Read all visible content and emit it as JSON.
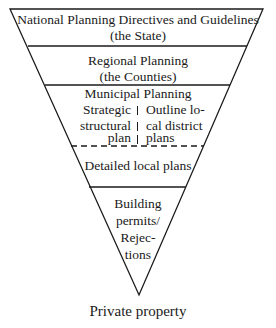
{
  "diagram": {
    "type": "inverted-pyramid",
    "levels": [
      {
        "line1": "National Planning Directives and Guidelines",
        "line2": "(the State)"
      },
      {
        "line1": "Regional Planning",
        "line2": "(the Counties)"
      },
      {
        "title": "Municipal Planning",
        "left": [
          "Strategic",
          "structural",
          "plan"
        ],
        "right": [
          "Outline lo-",
          "cal district",
          "plans"
        ]
      },
      {
        "line1": "Detailed local plans"
      },
      {
        "lines": [
          "Building",
          "permits/",
          "Rejec-",
          "tions"
        ]
      }
    ],
    "base_label": "Private property",
    "colors": {
      "stroke": "#1a1a1a",
      "background": "#ffffff"
    }
  }
}
